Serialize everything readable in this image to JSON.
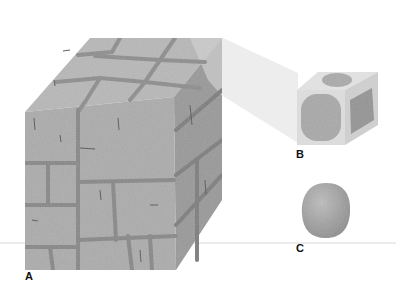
{
  "figure": {
    "labels": {
      "a": "A",
      "b": "B",
      "c": "C"
    },
    "colors": {
      "background": "#ffffff",
      "stone_front": "#adadad",
      "stone_top": "#b9b9b9",
      "stone_right": "#979797",
      "mortar": "#8a8a8a",
      "mortar_dark": "#7a7a7a",
      "beam": "#ececec",
      "cube_b_face": "#d9d9d9",
      "cube_b_blob": "#a7a7a7",
      "ball_c": "#a3a3a3",
      "ground_line": "#e6e6e6"
    }
  }
}
